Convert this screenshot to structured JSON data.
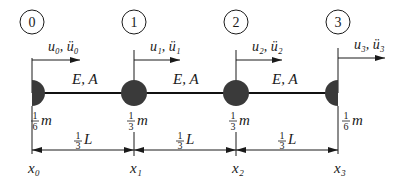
{
  "diagram": {
    "type": "lumped-mass bar model",
    "nodes": [
      {
        "id": "0",
        "disp": "u₀, ü₀",
        "mass_frac_num": "1",
        "mass_frac_den": "6",
        "mass_sym": "m",
        "coord": "x₀"
      },
      {
        "id": "1",
        "disp": "u₁, ü₁",
        "mass_frac_num": "1",
        "mass_frac_den": "3",
        "mass_sym": "m",
        "coord": "x₁"
      },
      {
        "id": "2",
        "disp": "u₂, ü₂",
        "mass_frac_num": "1",
        "mass_frac_den": "3",
        "mass_sym": "m",
        "coord": "x₂"
      },
      {
        "id": "3",
        "disp": "u₃, ü₃",
        "mass_frac_num": "1",
        "mass_frac_den": "6",
        "mass_sym": "m",
        "coord": "x₃"
      }
    ],
    "elements": [
      {
        "label": "E, A"
      },
      {
        "label": "E, A"
      },
      {
        "label": "E, A"
      }
    ],
    "spans": [
      {
        "num": "1",
        "den": "3",
        "sym": "L"
      },
      {
        "num": "1",
        "den": "3",
        "sym": "L"
      },
      {
        "num": "1",
        "den": "3",
        "sym": "L"
      }
    ]
  }
}
